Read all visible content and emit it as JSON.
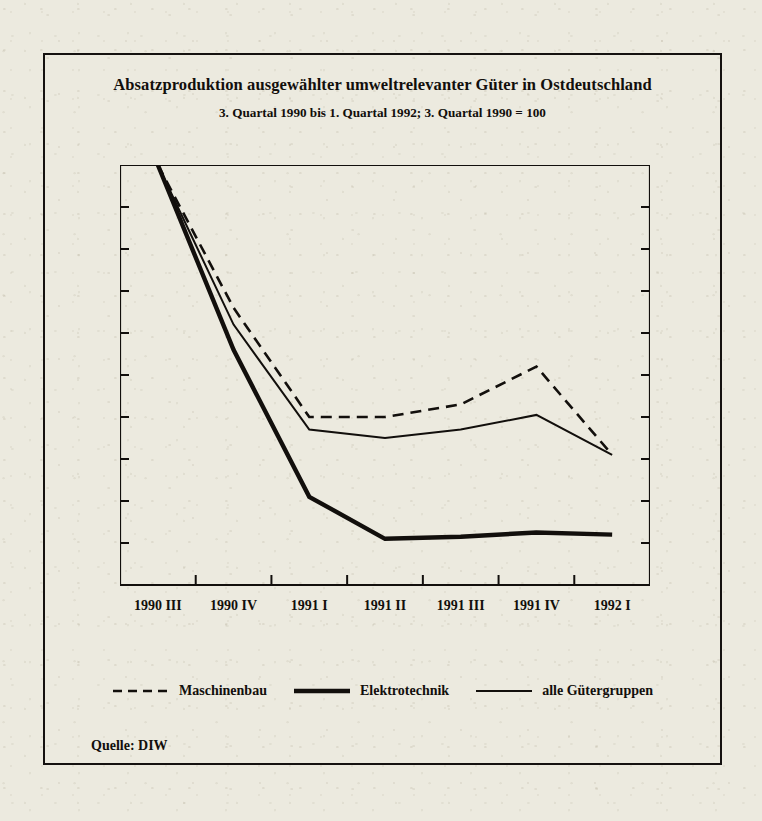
{
  "figure": {
    "title": "Absatzproduktion ausgewählter umweltrelevanter Güter in Ostdeutschland",
    "subtitle": "3. Quartal 1990 bis 1. Quartal 1992; 3. Quartal 1990 = 100",
    "source": "Quelle: DIW",
    "frame_color": "#151210",
    "paper_color": "#eceadf",
    "ink_color": "#120f0c"
  },
  "chart_data": {
    "type": "line",
    "title": "Absatzproduktion ausgewählter umweltrelevanter Güter in Ostdeutschland",
    "subtitle": "3. Quartal 1990 bis 1. Quartal 1992; 3. Quartal 1990 = 100",
    "xlabel": "",
    "ylabel": "",
    "categories": [
      "1990 III",
      "1990 IV",
      "1991 I",
      "1991 II",
      "1991 III",
      "1991 IV",
      "1992 I"
    ],
    "ylim": [
      0,
      100
    ],
    "yticks": [
      0,
      10,
      20,
      30,
      40,
      50,
      60,
      70,
      80,
      90,
      100
    ],
    "grid": false,
    "dual_y_axis": true,
    "legend_position": "bottom",
    "series": [
      {
        "name": "Maschinenbau",
        "style": "dashed",
        "width": 2.6,
        "color": "#120f0c",
        "values": [
          100,
          66,
          40,
          40,
          43,
          52,
          31
        ]
      },
      {
        "name": "Elektrotechnik",
        "style": "solid-thick",
        "width": 4.4,
        "color": "#120f0c",
        "values": [
          100,
          56,
          21,
          11,
          11.5,
          12.5,
          12
        ]
      },
      {
        "name": "alle Gütergruppen",
        "style": "solid-thin",
        "width": 2.0,
        "color": "#120f0c",
        "values": [
          100,
          62,
          37,
          35,
          37,
          40.5,
          31
        ]
      }
    ]
  },
  "legend": {
    "items": [
      {
        "label": "Maschinenbau",
        "style": "dashed"
      },
      {
        "label": "Elektrotechnik",
        "style": "solid-thick"
      },
      {
        "label": "alle Gütergruppen",
        "style": "solid-thin"
      }
    ]
  },
  "axis": {
    "y_left_ticks": [
      "100",
      "90",
      "80",
      "70",
      "60",
      "50",
      "40",
      "30",
      "20",
      "10",
      "0"
    ],
    "y_right_ticks": [
      "100",
      "90",
      "80",
      "70",
      "60",
      "50",
      "40",
      "30",
      "20",
      "10",
      "0"
    ],
    "x_ticks": [
      "1990 III",
      "1990 IV",
      "1991 I",
      "1991 II",
      "1991 III",
      "1991 IV",
      "1992 I"
    ]
  }
}
